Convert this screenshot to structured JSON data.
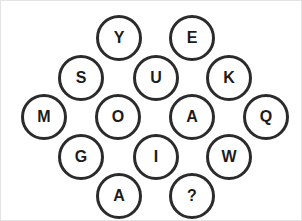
{
  "puzzle": {
    "type": "letter-circle-grid",
    "shape": "hexagonal-diamond",
    "circle_count": 15,
    "colors": {
      "background": "#ffffff",
      "circle_stroke": "#2b2b2b",
      "circle_fill": "#ffffff",
      "letter": "#1c1c1c",
      "canvas_border": "#e3e3e3"
    },
    "circle_diameter": 46,
    "stroke_width": 3,
    "circles": [
      {
        "id": "circle-y",
        "label": "Y",
        "x": 95,
        "y": 14,
        "row": 1,
        "col": 1
      },
      {
        "id": "circle-e",
        "label": "E",
        "x": 168,
        "y": 14,
        "row": 1,
        "col": 2
      },
      {
        "id": "circle-s",
        "label": "S",
        "x": 57,
        "y": 54,
        "row": 2,
        "col": 1
      },
      {
        "id": "circle-u",
        "label": "U",
        "x": 132,
        "y": 54,
        "row": 2,
        "col": 2
      },
      {
        "id": "circle-k",
        "label": "K",
        "x": 205,
        "y": 54,
        "row": 2,
        "col": 3
      },
      {
        "id": "circle-m",
        "label": "M",
        "x": 20,
        "y": 93,
        "row": 3,
        "col": 1
      },
      {
        "id": "circle-o",
        "label": "O",
        "x": 94,
        "y": 93,
        "row": 3,
        "col": 2
      },
      {
        "id": "circle-a1",
        "label": "A",
        "x": 168,
        "y": 93,
        "row": 3,
        "col": 3
      },
      {
        "id": "circle-q",
        "label": "Q",
        "x": 242,
        "y": 93,
        "row": 3,
        "col": 4
      },
      {
        "id": "circle-g",
        "label": "G",
        "x": 57,
        "y": 133,
        "row": 4,
        "col": 1
      },
      {
        "id": "circle-i",
        "label": "I",
        "x": 132,
        "y": 133,
        "row": 4,
        "col": 2
      },
      {
        "id": "circle-w",
        "label": "W",
        "x": 205,
        "y": 133,
        "row": 4,
        "col": 3
      },
      {
        "id": "circle-a2",
        "label": "A",
        "x": 95,
        "y": 172,
        "row": 5,
        "col": 1
      },
      {
        "id": "circle-question",
        "label": "?",
        "x": 168,
        "y": 172,
        "row": 5,
        "col": 2
      }
    ]
  }
}
